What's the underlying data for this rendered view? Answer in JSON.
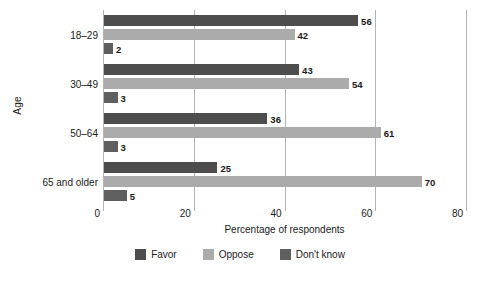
{
  "chart_data": {
    "type": "bar",
    "orientation": "horizontal",
    "title": "",
    "subtitle": "",
    "xlabel": "Percentage of respondents",
    "ylabel": "Age",
    "xlim": [
      0,
      80
    ],
    "xticks": [
      0,
      20,
      40,
      60,
      80
    ],
    "xtick_labels": [
      "0",
      "20",
      "40",
      "60",
      "80"
    ],
    "grid": true,
    "legend_position": "bottom",
    "categories": [
      "18–29",
      "30–49",
      "50–64",
      "65 and older"
    ],
    "series": [
      {
        "name": "Favor",
        "color": "#4d4d4d",
        "values": [
          56,
          43,
          36,
          25
        ],
        "labels": [
          "56",
          "43",
          "36",
          "25"
        ]
      },
      {
        "name": "Oppose",
        "color": "#ababab",
        "values": [
          42,
          54,
          61,
          70
        ],
        "labels": [
          "42",
          "54",
          "61",
          "70"
        ]
      },
      {
        "name": "Don't know",
        "color": "#5f5f5f",
        "values": [
          2,
          3,
          3,
          5
        ],
        "labels": [
          "2",
          "3",
          "3",
          "5"
        ]
      }
    ]
  },
  "axis": {
    "y_title": "Age",
    "x_title": "Percentage of respondents",
    "cat_0": "18–29",
    "cat_1": "30–49",
    "cat_2": "50–64",
    "cat_3": "65 and older",
    "tick_0": "0",
    "tick_1": "20",
    "tick_2": "40",
    "tick_3": "60",
    "tick_4": "80"
  },
  "legend": {
    "items": [
      {
        "label": "Favor",
        "color": "#4d4d4d"
      },
      {
        "label": "Oppose",
        "color": "#ababab"
      },
      {
        "label": "Don't know",
        "color": "#5f5f5f"
      }
    ]
  },
  "values": {
    "g0s0": "56",
    "g0s1": "42",
    "g0s2": "2",
    "g1s0": "43",
    "g1s1": "54",
    "g1s2": "3",
    "g2s0": "36",
    "g2s1": "61",
    "g2s2": "3",
    "g3s0": "25",
    "g3s1": "70",
    "g3s2": "5"
  }
}
